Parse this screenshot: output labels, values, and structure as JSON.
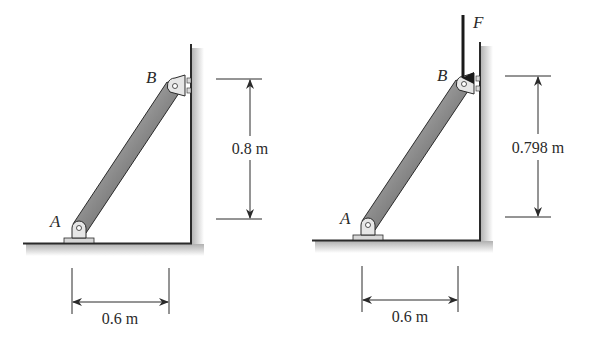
{
  "figures": [
    {
      "id": "left",
      "point_a_label": "A",
      "point_b_label": "B",
      "vertical_dimension": "0.8 m",
      "horizontal_dimension": "0.6 m"
    },
    {
      "id": "right",
      "point_a_label": "A",
      "point_b_label": "B",
      "force_label": "F",
      "vertical_dimension": "0.798 m",
      "horizontal_dimension": "0.6 m"
    }
  ],
  "colors": {
    "line": "#2a2a2a",
    "shadow": "#c8c8c8",
    "bar_dark": "#555555",
    "bar_light": "#cfcfcf",
    "pin": "#e6e6e6"
  }
}
